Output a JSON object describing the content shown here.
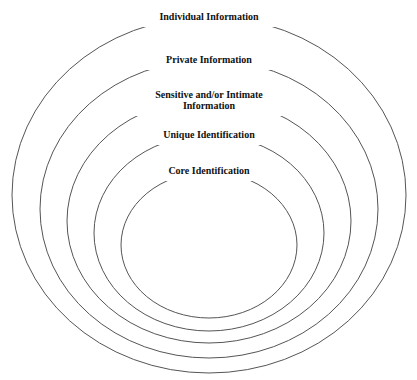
{
  "diagram": {
    "type": "nested-ellipses",
    "stroke_color": "#555555",
    "layers": [
      {
        "label_lines": [
          "Individual Information"
        ],
        "cx": 209,
        "cy": 195,
        "rx": 197,
        "ry": 178,
        "label_y": 20,
        "label_width": 128
      },
      {
        "label_lines": [
          "Private Information"
        ],
        "cx": 209,
        "cy": 209,
        "rx": 169,
        "ry": 149,
        "label_y": 63,
        "label_width": 110
      },
      {
        "label_lines": [
          "Sensitive and/or Intimate",
          "Information"
        ],
        "cx": 209,
        "cy": 221,
        "rx": 142,
        "ry": 122,
        "label_y": 98,
        "label_width": 140
      },
      {
        "label_lines": [
          "Unique Identification"
        ],
        "cx": 209,
        "cy": 233,
        "rx": 115,
        "ry": 98,
        "label_y": 138,
        "label_width": 120
      },
      {
        "label_lines": [
          "Core Identification"
        ],
        "cx": 209,
        "cy": 245,
        "rx": 88,
        "ry": 73,
        "label_y": 174,
        "label_width": 104
      }
    ]
  }
}
